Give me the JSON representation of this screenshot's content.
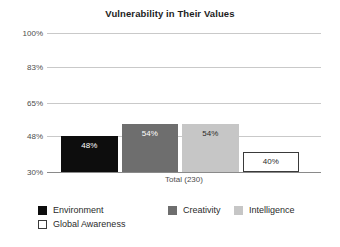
{
  "chart_data": {
    "type": "bar",
    "title": "Vulnerability in Their Values",
    "xlabel": "Total (230)",
    "ylabel": "",
    "categories": [
      "Total (230)"
    ],
    "ylim": [
      30,
      100
    ],
    "yticks": [
      100,
      83,
      65,
      48,
      30
    ],
    "ytick_labels": [
      "100%",
      "83%",
      "65%",
      "48%",
      "30%"
    ],
    "grid": true,
    "legend_position": "bottom",
    "series": [
      {
        "name": "Environment",
        "values": [
          48
        ],
        "value_labels": [
          "48%"
        ],
        "color": "#0d0d0d",
        "border": "#0d0d0d",
        "label_color": "light"
      },
      {
        "name": "Creativity",
        "values": [
          54
        ],
        "value_labels": [
          "54%"
        ],
        "color": "#6e6e6e",
        "border": "#6e6e6e",
        "label_color": "light"
      },
      {
        "name": "Intelligence",
        "values": [
          54
        ],
        "value_labels": [
          "54%"
        ],
        "color": "#c6c6c6",
        "border": "#c6c6c6",
        "label_color": "dark"
      },
      {
        "name": "Global Awareness",
        "values": [
          40
        ],
        "value_labels": [
          "40%"
        ],
        "color": "#ffffff",
        "border": "#3a3a3a",
        "label_color": "dark"
      }
    ]
  },
  "legend": {
    "rows": [
      [
        {
          "label": "Environment",
          "color": "#0d0d0d",
          "border": "#0d0d0d"
        },
        {
          "label": "Creativity",
          "color": "#6e6e6e",
          "border": "#6e6e6e"
        },
        {
          "label": "Intelligence",
          "color": "#c6c6c6",
          "border": "#c6c6c6"
        }
      ],
      [
        {
          "label": "Global Awareness",
          "color": "#ffffff",
          "border": "#3a3a3a"
        }
      ]
    ]
  },
  "colors": {
    "gridline": "#c9c9c9",
    "axis": "#8a8a8a",
    "title_text": "#1d1d1d",
    "tick_text": "#4d4d4d"
  }
}
